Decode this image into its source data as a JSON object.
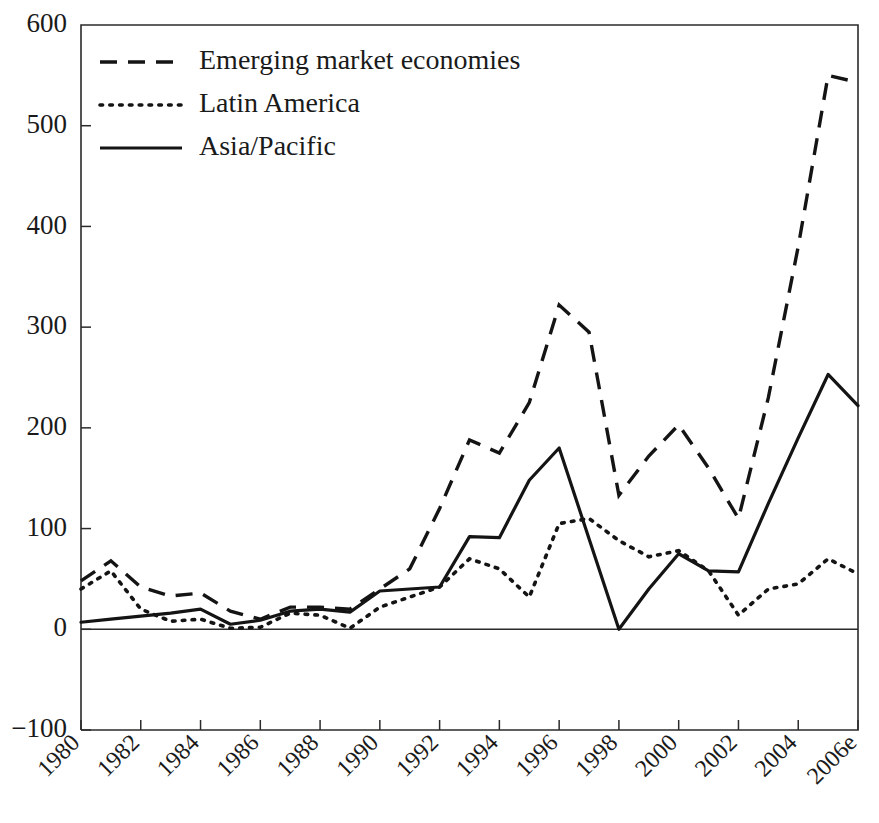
{
  "chart_data": {
    "type": "line",
    "title": "",
    "subtitle": "",
    "xlabel": "",
    "ylabel": "",
    "xlim": [
      1980,
      2006
    ],
    "ylim": [
      -100,
      600
    ],
    "yticks": [
      -100,
      0,
      100,
      200,
      300,
      400,
      500,
      600
    ],
    "ytick_labels": [
      "−100",
      "0",
      "100",
      "200",
      "300",
      "400",
      "500",
      "600"
    ],
    "x": [
      1980,
      1981,
      1982,
      1983,
      1984,
      1985,
      1986,
      1987,
      1988,
      1989,
      1990,
      1991,
      1992,
      1993,
      1994,
      1995,
      1996,
      1997,
      1998,
      1999,
      2000,
      2001,
      2002,
      2003,
      2004,
      2005,
      2006
    ],
    "xticks": [
      1980,
      1982,
      1984,
      1986,
      1988,
      1990,
      1992,
      1994,
      1996,
      1998,
      2000,
      2002,
      2004,
      2006
    ],
    "xtick_labels": [
      "1980",
      "1982",
      "1984",
      "1986",
      "1988",
      "1990",
      "1992",
      "1994",
      "1996",
      "1998",
      "2000",
      "2002",
      "2004",
      "2006e"
    ],
    "grid": false,
    "legend_position": "top-left",
    "series": [
      {
        "name": "Emerging market economies",
        "style": "dashed",
        "values": [
          48,
          68,
          42,
          33,
          36,
          18,
          10,
          22,
          22,
          20,
          40,
          60,
          120,
          188,
          175,
          225,
          322,
          295,
          133,
          172,
          203,
          160,
          110,
          230,
          380,
          550,
          543
        ]
      },
      {
        "name": "Latin America",
        "style": "dotted",
        "values": [
          40,
          58,
          20,
          8,
          10,
          1,
          2,
          16,
          14,
          1,
          22,
          32,
          42,
          70,
          60,
          32,
          105,
          110,
          88,
          72,
          78,
          58,
          14,
          40,
          45,
          70,
          55
        ]
      },
      {
        "name": "Asia/Pacific",
        "style": "solid",
        "values": [
          7,
          10,
          13,
          16,
          20,
          5,
          9,
          18,
          20,
          17,
          38,
          40,
          42,
          92,
          91,
          148,
          180,
          90,
          0,
          40,
          75,
          58,
          57,
          125,
          190,
          253,
          222
        ]
      }
    ],
    "legend": [
      {
        "label": "Emerging market economies",
        "style": "dashed"
      },
      {
        "label": "Latin America",
        "style": "dotted"
      },
      {
        "label": "Asia/Pacific",
        "style": "solid"
      }
    ]
  },
  "colors": {
    "ink": "#141414",
    "axis": "#2b2b2b",
    "background": "#ffffff"
  }
}
